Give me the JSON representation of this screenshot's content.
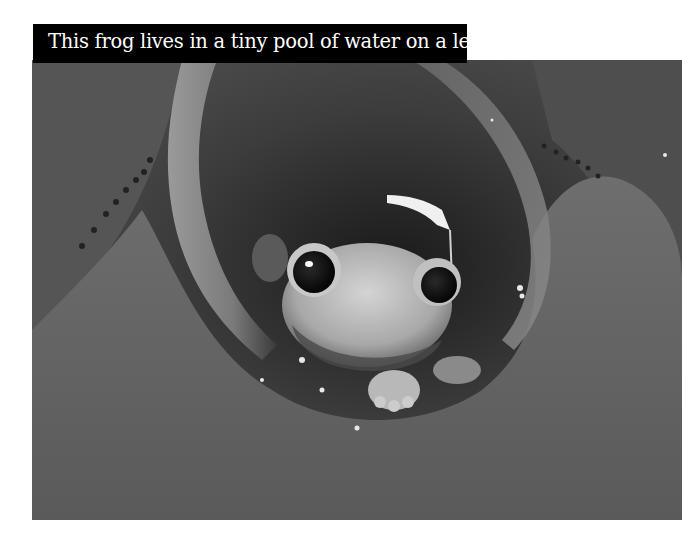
{
  "caption": {
    "text": "This frog lives in a tiny pool of water on a leaf."
  },
  "photo": {
    "subject": "frog-in-bromeliad-leaf",
    "tone": "grayscale"
  },
  "colors": {
    "caption_background": "#000000",
    "caption_text": "#ffffff",
    "page_background": "#ffffff"
  }
}
